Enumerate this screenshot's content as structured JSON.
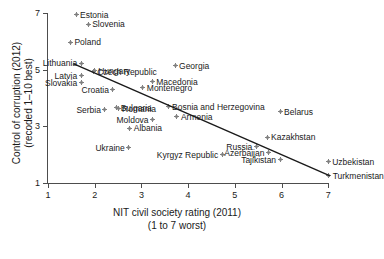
{
  "chart_data": {
    "type": "scatter",
    "title": "",
    "xlabel": "NIT civil society rating (2011)",
    "xlabel_line2": "(1 to 7 worst)",
    "ylabel": "Control of corruption (2012)",
    "ylabel_line2": "(recoded 1–10 best)",
    "xlim": [
      1,
      7
    ],
    "ylim": [
      1,
      7
    ],
    "xticks": [
      1,
      2,
      3,
      4,
      5,
      6,
      7
    ],
    "yticks": [
      1,
      3,
      5,
      7
    ],
    "grid": false,
    "legend": "none",
    "marker_color": "#808080",
    "line_color": "#1a1a1a",
    "fit_line": {
      "x0": 1.54,
      "y0": 5.21,
      "x1": 7.04,
      "y1": 1.25
    },
    "points": [
      {
        "label": "Estonia",
        "x": 1.6,
        "y": 6.94,
        "lp": "right"
      },
      {
        "label": "Slovenia",
        "x": 1.86,
        "y": 6.6,
        "lp": "right"
      },
      {
        "label": "Poland",
        "x": 1.48,
        "y": 5.97,
        "lp": "right"
      },
      {
        "label": "Lithuania",
        "x": 1.71,
        "y": 5.22,
        "lp": "left"
      },
      {
        "label": "Hungary",
        "x": 1.99,
        "y": 4.96,
        "lp": "right"
      },
      {
        "label": "Czech Republic",
        "x": 1.97,
        "y": 4.93,
        "lp": "right"
      },
      {
        "label": "Latvia",
        "x": 1.71,
        "y": 4.78,
        "lp": "left"
      },
      {
        "label": "Slovakia",
        "x": 1.71,
        "y": 4.53,
        "lp": "left"
      },
      {
        "label": "Croatia",
        "x": 2.39,
        "y": 4.29,
        "lp": "left"
      },
      {
        "label": "Montenegro",
        "x": 3.03,
        "y": 4.36,
        "lp": "right"
      },
      {
        "label": "Macedonia",
        "x": 3.23,
        "y": 4.57,
        "lp": "right"
      },
      {
        "label": "Georgia",
        "x": 3.72,
        "y": 5.13,
        "lp": "right"
      },
      {
        "label": "Bulgaria",
        "x": 2.47,
        "y": 3.66,
        "lp": "right"
      },
      {
        "label": "Serbia",
        "x": 2.22,
        "y": 3.58,
        "lp": "left"
      },
      {
        "label": "Romania",
        "x": 2.5,
        "y": 3.62,
        "lp": "right"
      },
      {
        "label": "Bosnia and Herzegovina",
        "x": 3.57,
        "y": 3.69,
        "lp": "right"
      },
      {
        "label": "Moldova",
        "x": 3.24,
        "y": 3.23,
        "lp": "left"
      },
      {
        "label": "Armenia",
        "x": 3.76,
        "y": 3.34,
        "lp": "right"
      },
      {
        "label": "Albania",
        "x": 2.75,
        "y": 2.94,
        "lp": "right"
      },
      {
        "label": "Ukraine",
        "x": 2.73,
        "y": 2.24,
        "lp": "left"
      },
      {
        "label": "Kyrgyz Republic",
        "x": 4.73,
        "y": 2.0,
        "lp": "left"
      },
      {
        "label": "Russia",
        "x": 5.46,
        "y": 2.28,
        "lp": "left"
      },
      {
        "label": "Azerbaijan",
        "x": 5.72,
        "y": 2.07,
        "lp": "left"
      },
      {
        "label": "Tajikistan",
        "x": 5.97,
        "y": 1.82,
        "lp": "left"
      },
      {
        "label": "Kazakhstan",
        "x": 5.69,
        "y": 2.61,
        "lp": "right"
      },
      {
        "label": "Belarus",
        "x": 5.97,
        "y": 3.51,
        "lp": "right"
      },
      {
        "label": "Uzbekistan",
        "x": 7.0,
        "y": 1.75,
        "lp": "right"
      },
      {
        "label": "Turkmenistan",
        "x": 7.01,
        "y": 1.25,
        "lp": "right"
      }
    ]
  }
}
